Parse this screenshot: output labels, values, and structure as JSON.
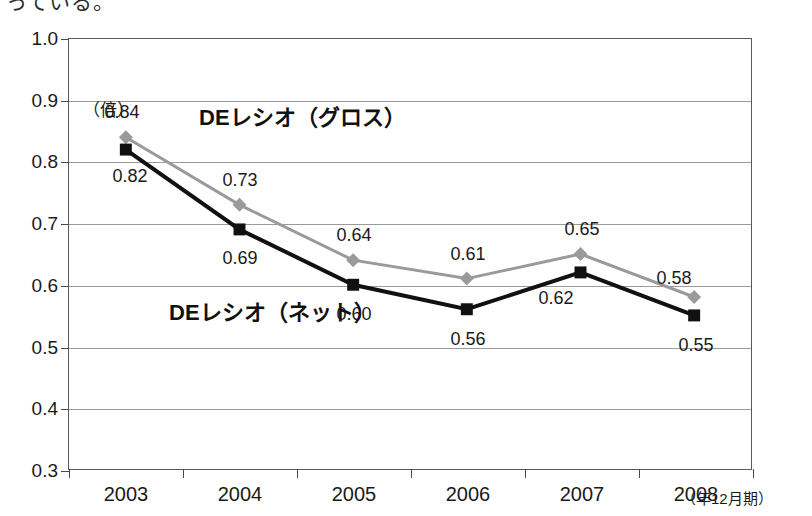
{
  "top_text": "っている。",
  "chart_data": {
    "type": "line",
    "title": "",
    "xlabel": "",
    "ylabel": "",
    "y_unit": "（倍）",
    "x_axis_note": "（年12月期）",
    "categories": [
      "2003",
      "2004",
      "2005",
      "2006",
      "2007",
      "2008"
    ],
    "ylim": [
      0.3,
      1.0
    ],
    "y_ticks": [
      "1.0",
      "0.9",
      "0.8",
      "0.7",
      "0.6",
      "0.5",
      "0.4",
      "0.3"
    ],
    "y_tick_values": [
      1.0,
      0.9,
      0.8,
      0.7,
      0.6,
      0.5,
      0.4,
      0.3
    ],
    "grid": true,
    "legend": "inline-labels",
    "series": [
      {
        "name": "DEレシオ（グロス）",
        "color": "#9a9a9a",
        "marker": "diamond",
        "values": [
          0.84,
          0.73,
          0.64,
          0.61,
          0.65,
          0.58
        ],
        "labels": [
          "0.84",
          "0.73",
          "0.64",
          "0.61",
          "0.65",
          "0.58"
        ]
      },
      {
        "name": "DEレシオ（ネット）",
        "color": "#111111",
        "marker": "square",
        "values": [
          0.82,
          0.69,
          0.6,
          0.56,
          0.62,
          0.55
        ],
        "labels": [
          "0.82",
          "0.69",
          "0.60",
          "0.56",
          "0.62",
          "0.55"
        ]
      }
    ]
  }
}
